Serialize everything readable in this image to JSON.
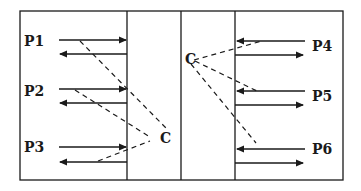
{
  "diagram": {
    "type": "process-communication-diagram",
    "left_panel": {
      "processes": [
        {
          "label": "P1"
        },
        {
          "label": "P2"
        },
        {
          "label": "P3"
        }
      ],
      "coordinator_label": "C"
    },
    "right_panel": {
      "processes": [
        {
          "label": "P4"
        },
        {
          "label": "P5"
        },
        {
          "label": "P6"
        }
      ],
      "coordinator_label": "C"
    },
    "colors": {
      "stroke": "#1a1a1a",
      "background": "#ffffff"
    }
  }
}
